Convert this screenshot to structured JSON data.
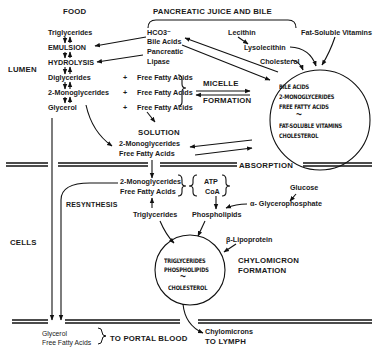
{
  "headers": {
    "food": "FOOD",
    "pancreatic": "PANCREATIC JUICE AND BILE"
  },
  "regions": {
    "lumen": "LUMEN",
    "cells": "CELLS",
    "absorption": "ABSORPTION"
  },
  "lumen": {
    "food_column": [
      "Triglycerides",
      "EMULSION",
      "HYDROLYSIS",
      "Diglycerides",
      "2-Monoglycerides",
      "Glycerol"
    ],
    "pancreatic_items": [
      "HCO3⁻",
      "Bile Acids",
      "Pancreatic",
      "Lipase"
    ],
    "plus": "+",
    "free_fatty_acids": [
      "Free Fatty Acids",
      "Free Fatty Acids",
      "Free Fatty Acids"
    ],
    "micelle": "MICELLE",
    "formation": "FORMATION",
    "lecithin": "Lecithin",
    "lysolecithin": "Lysolecithin",
    "cholesterol": "Cholesterol",
    "fat_soluble_vitamins": "Fat-Soluble Vitamins",
    "micelle_circle": [
      "BILE ACIDS",
      "2-MONOGLYCERIDES",
      "FREE FATTY ACIDS",
      "~",
      "FAT-SOLUBLE VITAMINS",
      "CHOLESTEROL"
    ],
    "solution": "SOLUTION",
    "solution_items": [
      "2-Monoglycerides",
      "Free Fatty Acids"
    ]
  },
  "cells": {
    "absorbed": [
      "2-Monoglycerides",
      "Free Fatty Acids"
    ],
    "cofactors": [
      "ATP",
      "CoA"
    ],
    "glucose": "Glucose",
    "glycerophosphate": "α- Glycerophosphate",
    "resynthesis": "RESYNTHESIS",
    "triglycerides": "Triglycerides",
    "phospholipids": "Phospholipids",
    "beta_lipoprotein": "β-Lipoprotein",
    "chylomicron_circle": [
      "TRIGLYCERIDES",
      "PHOSPHOLIPIDS",
      "~",
      "CHOLESTEROL"
    ],
    "chylomicron_formation": [
      "CHYLOMICRON",
      "FORMATION"
    ]
  },
  "outputs": {
    "portal_items": [
      "Glycerol",
      "Free Fatty Acids"
    ],
    "portal_blood": "TO PORTAL BLOOD",
    "chylomicrons": "Chylomicrons",
    "lymph": "TO LYMPH"
  }
}
